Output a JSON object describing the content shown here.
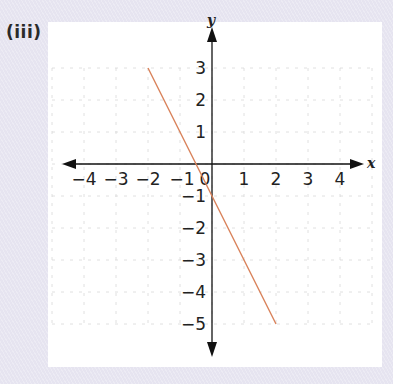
{
  "part_label": "(iii)",
  "chart_data": {
    "type": "line",
    "title": "",
    "xlabel": "x",
    "ylabel": "y",
    "xlim": [
      -4,
      4
    ],
    "ylim": [
      -5,
      3
    ],
    "grid": true,
    "x_ticks": [
      "−4",
      "−3",
      "−2",
      "−1",
      "0",
      "1",
      "2",
      "3",
      "4"
    ],
    "y_ticks": [
      "3",
      "2",
      "1",
      "−1",
      "−2",
      "−3",
      "−4",
      "−5"
    ],
    "series": [
      {
        "name": "y = −2x − 1",
        "color": "#d9825a",
        "points": [
          [
            -2,
            3
          ],
          [
            2,
            -5
          ]
        ]
      }
    ]
  },
  "colors": {
    "background": "#e6e4f0",
    "panel": "#ffffff",
    "axis": "#111111",
    "grid": "#d8d8d8",
    "line": "#d9825a"
  }
}
